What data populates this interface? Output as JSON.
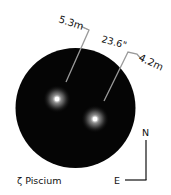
{
  "title": "ζ Piscium",
  "stars": [
    {
      "name": "primary",
      "magnitude": "5.3m",
      "cx": 57,
      "cy": 99
    },
    {
      "name": "companion",
      "magnitude": "4.2m",
      "cx": 95,
      "cy": 119
    }
  ],
  "separation": "23.6\"",
  "compass": {
    "north": "N",
    "east": "E"
  },
  "colors": {
    "field": "#050505",
    "leader": "#9a9a9a",
    "text": "#111111",
    "background": "#ffffff"
  }
}
